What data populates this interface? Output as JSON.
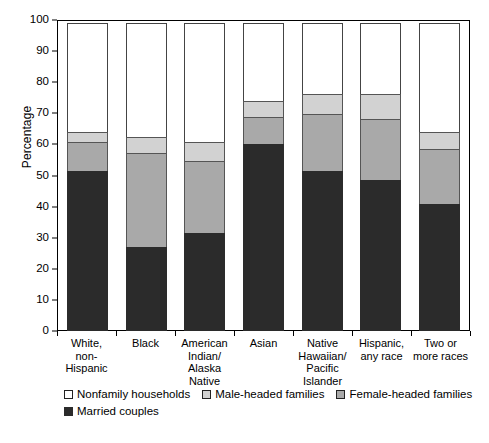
{
  "chart_data": {
    "type": "bar",
    "subtype": "stacked-bar-100",
    "title": "",
    "xlabel": "",
    "ylabel": "Percentage",
    "ylim": [
      0,
      100
    ],
    "ytick_step": 10,
    "yticks": [
      "0",
      "10",
      "20",
      "30",
      "40",
      "50",
      "60",
      "70",
      "80",
      "90",
      "100"
    ],
    "grid": false,
    "legend_position": "bottom-left",
    "categories": [
      "White,\nnon-Hispanic",
      "Black",
      "American\nIndian/\nAlaska\nNative",
      "Asian",
      "Native\nHawaiian/\nPacific\nIslander",
      "Hispanic,\nany race",
      "Two or\nmore races"
    ],
    "category_lines": [
      [
        "White,",
        "non-Hispanic"
      ],
      [
        "Black"
      ],
      [
        "American",
        "Indian/",
        "Alaska",
        "Native"
      ],
      [
        "Asian"
      ],
      [
        "Native",
        "Hawaiian/",
        "Pacific",
        "Islander"
      ],
      [
        "Hispanic,",
        "any race"
      ],
      [
        "Two or",
        "more races"
      ]
    ],
    "series": [
      {
        "name": "Married couples",
        "key": "married",
        "color": "#2b2b2b",
        "values": [
          51.5,
          27.0,
          31.5,
          60.0,
          51.5,
          48.5,
          41.0
        ]
      },
      {
        "name": "Female-headed families",
        "key": "female",
        "color": "#a9a9a9",
        "values": [
          9.5,
          30.5,
          23.5,
          9.0,
          18.5,
          20.0,
          18.0
        ]
      },
      {
        "name": "Male-headed families",
        "key": "male",
        "color": "#d2d2d2",
        "values": [
          3.5,
          5.5,
          6.5,
          5.5,
          7.0,
          8.5,
          5.5
        ]
      },
      {
        "name": "Nonfamily households",
        "key": "nonfamily",
        "color": "#ffffff",
        "values": [
          35.5,
          37.0,
          38.5,
          25.5,
          23.0,
          23.0,
          35.5
        ]
      }
    ],
    "legend": [
      {
        "label": "Nonfamily households",
        "key": "nonfamily",
        "color": "#ffffff"
      },
      {
        "label": "Male-headed families",
        "key": "male",
        "color": "#d2d2d2"
      },
      {
        "label": "Female-headed families",
        "key": "female",
        "color": "#a9a9a9"
      },
      {
        "label": "Married couples",
        "key": "married",
        "color": "#2b2b2b"
      }
    ]
  }
}
